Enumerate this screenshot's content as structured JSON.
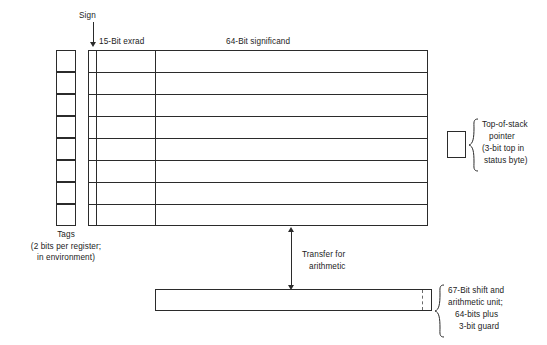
{
  "figure": {
    "title_alt": "Floating-point register stack diagram",
    "ink_color": "#2b2b2b",
    "background": "#ffffff"
  },
  "labels": {
    "sign": "Sign",
    "exponent_field": "15-Bit exrad",
    "significand_field": "64-Bit significand",
    "tags_title": "Tags",
    "tags_note_line1": "(2 bits per register;",
    "tags_note_line2": "in environment)",
    "top_of_stack_line1": "Top-of-stack",
    "top_of_stack_line2": "pointer",
    "top_of_stack_line3": "(3-bit top in",
    "top_of_stack_line4": "status byte)",
    "transfer_line1": "Transfer for",
    "transfer_line2": "arithmetic",
    "shift_unit_line1": "67-Bit shift and",
    "shift_unit_line2": "arithmetic unit;",
    "shift_unit_line3": "64-bits plus",
    "shift_unit_line4": "3-bit guard"
  },
  "structure": {
    "register_count": 8,
    "tag_cell_count": 8,
    "sign_bits": 1,
    "exponent_bits": 15,
    "significand_bits": 64,
    "shift_unit_bits": 67,
    "guard_bits": 3,
    "tag_bits_per_register": 2,
    "top_of_stack_pointer_bits": 3
  }
}
